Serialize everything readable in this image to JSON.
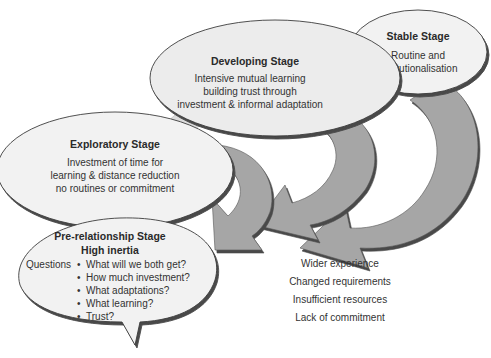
{
  "stages": [
    {
      "id": "stable",
      "title": "Stable Stage",
      "lines": [
        "Routine and",
        "institutionalisation"
      ]
    },
    {
      "id": "developing",
      "title": "Developing Stage",
      "lines": [
        "Intensive mutual learning",
        "building trust through",
        "investment & informal adaptation"
      ]
    },
    {
      "id": "exploratory",
      "title": "Exploratory Stage",
      "lines": [
        "Investment of time for",
        "learning & distance reduction",
        "no routines or commitment"
      ]
    },
    {
      "id": "pre-relationship",
      "title": "Pre-relationship Stage",
      "subtitle": "High inertia",
      "questions_label": "Questions",
      "questions": [
        "What will we both get?",
        "How much investment?",
        "What adaptations?",
        "What learning?",
        "Trust?"
      ]
    }
  ],
  "exit_factors": [
    "Wider experience",
    "Changed requirements",
    "Insufficient resources",
    "Lack of commitment"
  ],
  "colors": {
    "bubble_fill": "#f2f2f2",
    "bubble_overlap": "#d9d9d9",
    "arrow_fill": "#a6a6a6",
    "arrow_shadow": "#5a5a5a",
    "swoosh_fill": "#dcdcdc",
    "outline": "#3c3c3c"
  }
}
